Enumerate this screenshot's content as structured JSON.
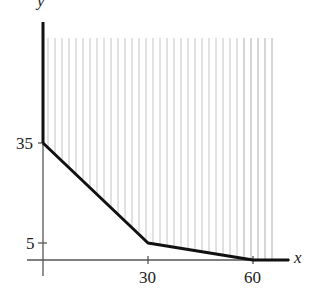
{
  "chart_data": {
    "type": "line",
    "title": "",
    "xlabel": "x",
    "ylabel": "y",
    "x_ticks": [
      30,
      60
    ],
    "y_ticks": [
      5,
      35
    ],
    "xlim": [
      0,
      70
    ],
    "ylim": [
      0,
      70
    ],
    "grid": false,
    "series": [
      {
        "name": "boundary",
        "x": [
          0,
          30,
          60,
          70
        ],
        "y": [
          35,
          5,
          0,
          0
        ]
      }
    ],
    "annotations": [
      "Region above the piecewise-linear boundary is shaded with vertical hatch lines (feasible region)"
    ],
    "shading": {
      "type": "vertical-hatch",
      "region": "above boundary",
      "color": "#b0b0b0"
    }
  },
  "labels": {
    "x_axis": "x",
    "y_axis": "y",
    "tick_x_30": "30",
    "tick_x_60": "60",
    "tick_y_5": "5",
    "tick_y_35": "35"
  },
  "colors": {
    "axis": "#555555",
    "boundary": "#111111",
    "hatch": "#b5b5b5"
  }
}
